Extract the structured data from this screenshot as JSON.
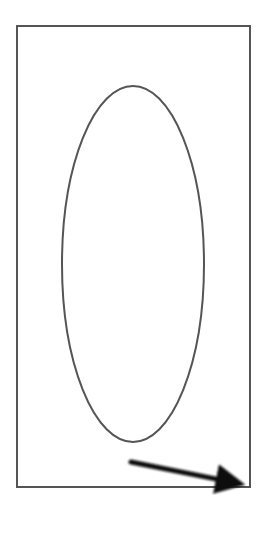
{
  "diagram": {
    "width": 268,
    "height": 538,
    "background": "#ffffff",
    "rectangle": {
      "x": 17,
      "y": 26,
      "width": 233,
      "height": 461,
      "stroke": "#555555",
      "stroke_width": 2
    },
    "ellipse": {
      "cx": 133,
      "cy": 264,
      "rx": 71,
      "ry": 178,
      "stroke": "#555555",
      "stroke_width": 2
    },
    "arrow": {
      "x1": 131,
      "y1": 462,
      "x2": 246,
      "y2": 485,
      "color": "#111111",
      "stroke_width": 5
    }
  }
}
